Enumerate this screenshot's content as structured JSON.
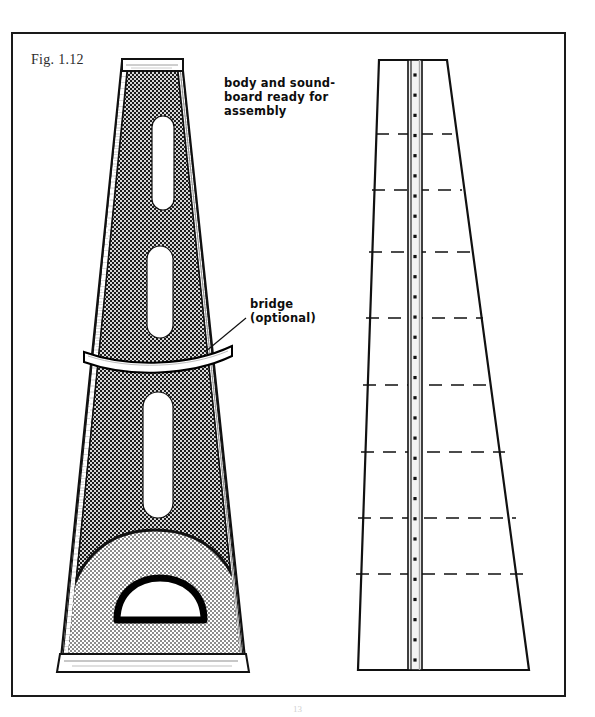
{
  "figure": {
    "number_label": "Fig. 1.12",
    "page_number": "13",
    "frame": {
      "x": 11,
      "y": 32,
      "width": 555,
      "height": 665,
      "stroke": "#1a1a1a",
      "stroke_width": 2
    }
  },
  "annotations": [
    {
      "name": "assembly-note",
      "text": "body and sound-\nboard ready for\nassembly",
      "x": 224,
      "y": 76
    },
    {
      "name": "bridge-note",
      "text": "bridge\n(optional)",
      "x": 250,
      "y": 297
    }
  ],
  "leader_line": {
    "name": "bridge-leader-line",
    "from_x": 246,
    "from_y": 318,
    "to_x": 205,
    "to_y": 352,
    "stroke": "#111111"
  },
  "left_view": {
    "title": "assembled-body-view",
    "outline": {
      "top_left_x": 124,
      "top_right_x": 180,
      "bottom_left_x": 62,
      "bottom_right_x": 245,
      "top_y": 62,
      "bottom_y": 672
    },
    "fill_dark": "#2b2b2b",
    "fill_light": "#c0c0c0",
    "rail_fill": "#ffffff",
    "nut_cap": {
      "x": 123,
      "y": 60,
      "width": 59,
      "height": 11,
      "fill": "#ffffff"
    },
    "slots": [
      {
        "name": "sound-slot-1",
        "cx": 163,
        "cy": 163,
        "rx": 11,
        "ry": 47
      },
      {
        "name": "sound-slot-2",
        "cx": 160,
        "cy": 292,
        "rx": 13,
        "ry": 46
      },
      {
        "name": "sound-slot-3",
        "cx": 158,
        "cy": 455,
        "rx": 15,
        "ry": 63
      }
    ],
    "bridge": {
      "name": "bridge-band",
      "fill": "#ffffff",
      "stroke": "#000000",
      "left_x": 84,
      "right_x": 232,
      "y": 352,
      "sag": 11
    },
    "lower_panel": {
      "name": "lower-soundboard-panel",
      "fill": "#c0c0c0",
      "left_x": 70,
      "right_x": 240,
      "base_y": 656,
      "apex_y": 545
    },
    "sound_hole": {
      "name": "d-shaped-sound-hole",
      "cx": 160,
      "base_y": 620,
      "rx": 44,
      "ry": 29,
      "fill": "#ffffff",
      "stroke": "#000000",
      "stroke_width": 7
    },
    "base_rail": {
      "name": "bottom-rail",
      "fill": "#ffffff",
      "stroke": "#111111"
    }
  },
  "right_view": {
    "title": "soundboard-flat-view",
    "outline": {
      "top_left_x": 379,
      "top_right_x": 447,
      "bottom_left_x": 358,
      "bottom_right_x": 529,
      "top_y": 60,
      "bottom_y": 672
    },
    "center_strip": {
      "name": "center-spine-strip",
      "left_x": 408,
      "right_x": 422,
      "top_y": 60,
      "bottom_y": 672,
      "fill": "#f2f2f2",
      "stroke": "#111111"
    },
    "pin_holes": {
      "name": "pin-hole-row",
      "cx": 415,
      "start_y": 75,
      "end_y": 660,
      "count": 30,
      "radius": 1.6,
      "fill": "#111111"
    },
    "brace_lines": {
      "name": "brace-dashed-lines",
      "stroke": "#111111",
      "dash": "13 9",
      "rows": [
        {
          "y": 134,
          "left_x": 376,
          "right_x": 452
        },
        {
          "y": 190,
          "left_x": 372,
          "right_x": 462
        },
        {
          "y": 252,
          "left_x": 369,
          "right_x": 472
        },
        {
          "y": 318,
          "left_x": 366,
          "right_x": 483
        },
        {
          "y": 385,
          "left_x": 363,
          "right_x": 494
        },
        {
          "y": 452,
          "left_x": 361,
          "right_x": 505
        },
        {
          "y": 518,
          "left_x": 358,
          "right_x": 516
        },
        {
          "y": 574,
          "left_x": 356,
          "right_x": 524
        }
      ]
    }
  },
  "colors": {
    "ink": "#111111",
    "dark_fill": "#2b2b2b",
    "light_fill": "#c0c0c0",
    "paper": "#ffffff"
  }
}
